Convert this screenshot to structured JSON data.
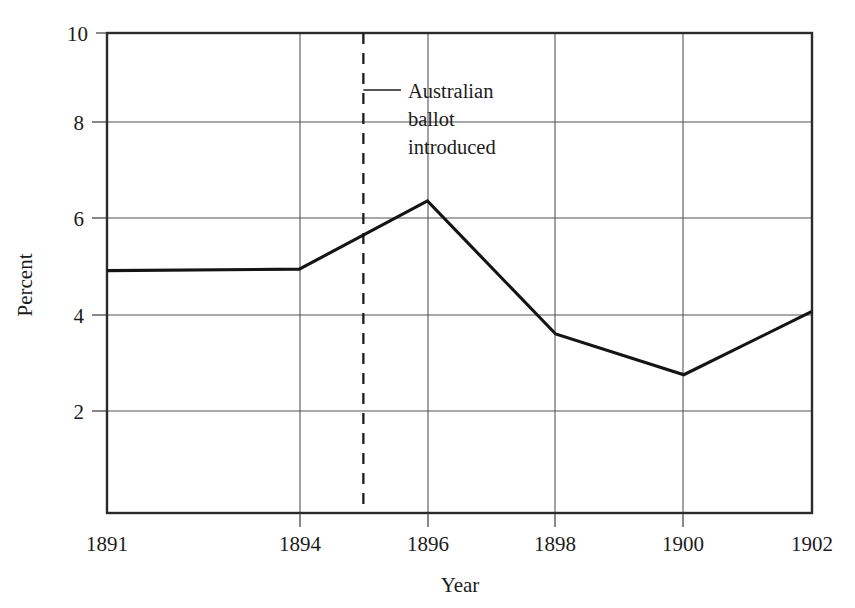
{
  "chart_data": {
    "type": "line",
    "title": "",
    "xlabel": "Year",
    "ylabel": "Percent",
    "x": [
      1891,
      1894,
      1896,
      1898,
      1900,
      1902
    ],
    "values": [
      5.05,
      5.08,
      6.5,
      3.73,
      2.88,
      4.2
    ],
    "series": [
      {
        "name": "Percent",
        "values": [
          5.05,
          5.08,
          6.5,
          3.73,
          2.88,
          4.2
        ]
      }
    ],
    "xlim": [
      1891,
      1902
    ],
    "ylim": [
      0,
      10
    ],
    "xticks": [
      1891,
      1894,
      1896,
      1898,
      1900,
      1902
    ],
    "xticklabels": [
      "1891",
      "1894",
      "1896",
      "1898",
      "1900",
      "1902"
    ],
    "yticks": [
      2,
      4,
      6,
      8,
      10
    ],
    "yticklabels": [
      "2",
      "4",
      "6",
      "8",
      "10"
    ],
    "grid": "both",
    "legend": "none",
    "annotations": [
      {
        "text_lines": [
          "Australian",
          "ballot",
          "introduced"
        ],
        "text": "Australian ballot introduced",
        "x": 1895,
        "marker": "dashed-vertical-line"
      }
    ],
    "colors": {
      "data_line": "#141414",
      "gridline": "#555555",
      "frame": "#2b2b2b",
      "background": "#ffffff"
    }
  },
  "axis": {
    "y_title": "Percent",
    "x_title": "Year",
    "y_tick_0": "2",
    "y_tick_1": "4",
    "y_tick_2": "6",
    "y_tick_3": "8",
    "y_tick_4": "10",
    "x_tick_0": "1891",
    "x_tick_1": "1894",
    "x_tick_2": "1896",
    "x_tick_3": "1898",
    "x_tick_4": "1900",
    "x_tick_5": "1902"
  },
  "annotation": {
    "line1": "Australian",
    "line2": "ballot",
    "line3": "introduced"
  }
}
